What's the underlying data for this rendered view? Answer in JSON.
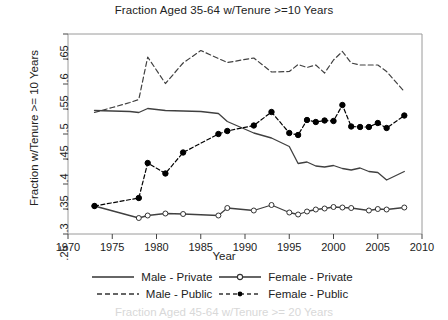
{
  "chart_data": {
    "type": "line",
    "title": "Fraction Aged 35-64 w/Tenure >=10 Years",
    "xlabel": "Year",
    "ylabel": "Fraction w/Tenure >= 10 Years",
    "xlim": [
      1970,
      2010
    ],
    "ylim": [
      0.25,
      0.65
    ],
    "xticks": [
      1970,
      1975,
      1980,
      1985,
      1990,
      1995,
      2000,
      2005,
      2010
    ],
    "yticks": [
      ".25",
      ".3",
      ".35",
      ".4",
      ".45",
      ".5",
      ".55",
      ".6",
      ".65"
    ],
    "ytick_values": [
      0.25,
      0.3,
      0.35,
      0.4,
      0.45,
      0.5,
      0.55,
      0.6,
      0.65
    ],
    "grid": false,
    "legend_position": "below",
    "series": [
      {
        "name": "Male - Private",
        "style": "solid",
        "marker": "none",
        "color": "#404040",
        "x": [
          1973,
          1975,
          1977,
          1978,
          1979,
          1981,
          1983,
          1985,
          1987,
          1988,
          1991,
          1993,
          1995,
          1996,
          1997,
          1998,
          1999,
          2000,
          2001,
          2002,
          2003,
          2004,
          2005,
          2006,
          2008
        ],
        "y": [
          0.497,
          0.496,
          0.495,
          0.493,
          0.501,
          0.497,
          0.496,
          0.495,
          0.491,
          0.475,
          0.452,
          0.442,
          0.425,
          0.391,
          0.394,
          0.386,
          0.384,
          0.387,
          0.381,
          0.378,
          0.382,
          0.375,
          0.373,
          0.358,
          0.375
        ]
      },
      {
        "name": "Female - Private",
        "style": "solid",
        "marker": "open-circle",
        "color": "#404040",
        "x": [
          1973,
          1978,
          1979,
          1981,
          1983,
          1987,
          1988,
          1991,
          1993,
          1995,
          1996,
          1997,
          1998,
          1999,
          2000,
          2001,
          2002,
          2004,
          2005,
          2006,
          2008
        ],
        "y": [
          0.306,
          0.282,
          0.287,
          0.291,
          0.29,
          0.287,
          0.302,
          0.297,
          0.308,
          0.293,
          0.289,
          0.295,
          0.299,
          0.301,
          0.304,
          0.303,
          0.302,
          0.297,
          0.3,
          0.299,
          0.303
        ]
      },
      {
        "name": "Male - Public",
        "style": "dashed",
        "marker": "none",
        "color": "#404040",
        "x": [
          1973,
          1975,
          1977,
          1978,
          1979,
          1981,
          1983,
          1985,
          1987,
          1988,
          1991,
          1993,
          1995,
          1996,
          1997,
          1998,
          1999,
          2000,
          2001,
          2002,
          2003,
          2004,
          2005,
          2006,
          2008
        ],
        "y": [
          0.493,
          0.503,
          0.513,
          0.519,
          0.604,
          0.551,
          0.592,
          0.617,
          0.601,
          0.593,
          0.602,
          0.574,
          0.575,
          0.589,
          0.583,
          0.588,
          0.572,
          0.598,
          0.615,
          0.592,
          0.588,
          0.588,
          0.588,
          0.575,
          0.535
        ]
      },
      {
        "name": "Female - Public",
        "style": "dashed",
        "marker": "filled-circle",
        "color": "#000000",
        "x": [
          1973,
          1978,
          1979,
          1981,
          1983,
          1987,
          1988,
          1991,
          1993,
          1995,
          1996,
          1997,
          1998,
          1999,
          2000,
          2001,
          2002,
          2003,
          2004,
          2005,
          2006,
          2008
        ],
        "y": [
          0.306,
          0.322,
          0.392,
          0.371,
          0.413,
          0.45,
          0.456,
          0.467,
          0.494,
          0.452,
          0.448,
          0.478,
          0.474,
          0.477,
          0.476,
          0.508,
          0.465,
          0.464,
          0.464,
          0.472,
          0.462,
          0.487
        ]
      }
    ]
  },
  "legend": {
    "entries": [
      {
        "label": "Male - Private",
        "style": "solid",
        "marker": "none"
      },
      {
        "label": "Female - Private",
        "style": "solid",
        "marker": "open-circle"
      },
      {
        "label": "Male - Public",
        "style": "dashed",
        "marker": "none"
      },
      {
        "label": "Female - Public",
        "style": "dashed",
        "marker": "filled-circle"
      }
    ]
  },
  "footer": {
    "partial_next_title": "Fraction Aged 45-64 w/Tenure >= 20 Years"
  }
}
